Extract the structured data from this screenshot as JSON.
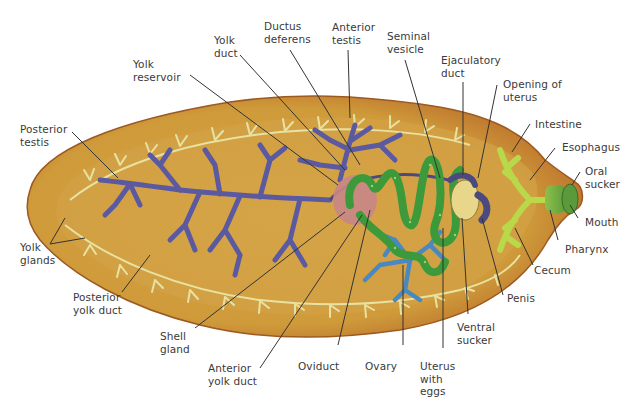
{
  "figure": {
    "colors": {
      "body": "#d4a03c",
      "body_edge": "#b86a2c",
      "yolk_glands": "#e8e3a0",
      "testes": "#5a5a9e",
      "ovary": "#4a86c0",
      "uterus": "#3f9a3c",
      "intestine": "#b8d84a",
      "shell_gland": "#c98a8a",
      "label_text": "#3a3a3a",
      "leader_line": "#333333"
    },
    "labels": [
      {
        "id": "yolk-reservoir",
        "text": "Yolk\nreservoir"
      },
      {
        "id": "yolk-duct",
        "text": "Yolk\nduct"
      },
      {
        "id": "ductus-deferens",
        "text": "Ductus\ndeferens"
      },
      {
        "id": "anterior-testis",
        "text": "Anterior\ntestis"
      },
      {
        "id": "seminal-vesicle",
        "text": "Seminal\nvesicle"
      },
      {
        "id": "ejaculatory-duct",
        "text": "Ejaculatory\nduct"
      },
      {
        "id": "opening-of-uterus",
        "text": "Opening of\nuterus"
      },
      {
        "id": "intestine",
        "text": "Intestine"
      },
      {
        "id": "esophagus",
        "text": "Esophagus"
      },
      {
        "id": "oral-sucker",
        "text": "Oral\nsucker"
      },
      {
        "id": "mouth",
        "text": "Mouth"
      },
      {
        "id": "pharynx",
        "text": "Pharynx"
      },
      {
        "id": "cecum",
        "text": "Cecum"
      },
      {
        "id": "penis",
        "text": "Penis"
      },
      {
        "id": "ventral-sucker",
        "text": "Ventral\nsucker"
      },
      {
        "id": "uterus-with-eggs",
        "text": "Uterus\nwith\neggs"
      },
      {
        "id": "ovary",
        "text": "Ovary"
      },
      {
        "id": "oviduct",
        "text": "Oviduct"
      },
      {
        "id": "anterior-yolk-duct",
        "text": "Anterior\nyolk duct"
      },
      {
        "id": "shell-gland",
        "text": "Shell\ngland"
      },
      {
        "id": "posterior-yolk-duct",
        "text": "Posterior\nyolk duct"
      },
      {
        "id": "yolk-glands",
        "text": "Yolk\nglands"
      },
      {
        "id": "posterior-testis",
        "text": "Posterior\ntestis"
      }
    ]
  }
}
